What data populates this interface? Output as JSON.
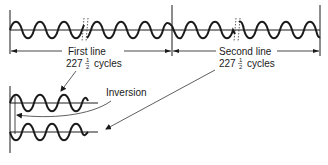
{
  "diagram": {
    "type": "waveform-timing",
    "top_section": {
      "lines": [
        {
          "label": "First line",
          "cycles_whole": "227",
          "cycles_num": "1",
          "cycles_den": "2",
          "cycles_unit": "cycles"
        },
        {
          "label": "Second line",
          "cycles_whole": "227",
          "cycles_num": "1",
          "cycles_den": "2",
          "cycles_unit": "cycles"
        }
      ]
    },
    "bottom_section": {
      "annotation": "Inversion"
    },
    "colors": {
      "ink": "#1a1a1a",
      "background": "#ffffff"
    }
  }
}
